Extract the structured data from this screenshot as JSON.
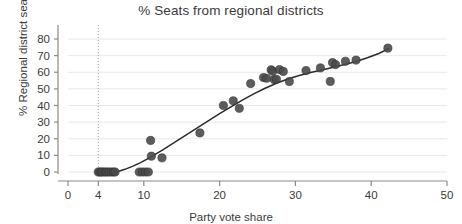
{
  "chart_data": {
    "type": "scatter",
    "title": "% Seats from regional districts",
    "xlabel": "Party vote share",
    "ylabel": "% Regional district seats",
    "xlim": [
      0,
      50
    ],
    "ylim": [
      -3,
      85
    ],
    "xticks": [
      0,
      4,
      10,
      20,
      30,
      40,
      50
    ],
    "xtick_labels": [
      "0",
      "4",
      "10",
      "20",
      "30",
      "40",
      "50"
    ],
    "yticks": [
      0,
      10,
      20,
      30,
      40,
      50,
      60,
      70,
      80
    ],
    "ytick_labels": [
      "0",
      "10",
      "20",
      "30",
      "40",
      "50",
      "60",
      "70",
      "80"
    ],
    "grid": "horizontal",
    "legend": "none",
    "marker_color": "#4a4a4a",
    "line_color": "#2b2b2b",
    "gridline_color": "#e8e8e8",
    "axis_color": "#8a8a8a",
    "reference_line": {
      "orientation": "vertical",
      "x": 4,
      "style": "dotted",
      "color": "#b0a89a"
    },
    "points": [
      {
        "x": 4.0,
        "y": 0.0
      },
      {
        "x": 4.2,
        "y": 0.0
      },
      {
        "x": 4.4,
        "y": 0.0
      },
      {
        "x": 4.6,
        "y": 0.0
      },
      {
        "x": 4.9,
        "y": 0.0
      },
      {
        "x": 5.1,
        "y": 0.0
      },
      {
        "x": 5.4,
        "y": 0.0
      },
      {
        "x": 5.7,
        "y": 0.0
      },
      {
        "x": 6.0,
        "y": 0.0
      },
      {
        "x": 6.2,
        "y": 0.0
      },
      {
        "x": 9.4,
        "y": 0.0
      },
      {
        "x": 9.8,
        "y": 0.0
      },
      {
        "x": 10.2,
        "y": 0.0
      },
      {
        "x": 10.6,
        "y": 0.0
      },
      {
        "x": 10.9,
        "y": 19.0
      },
      {
        "x": 11.0,
        "y": 9.5
      },
      {
        "x": 12.4,
        "y": 8.5
      },
      {
        "x": 17.4,
        "y": 23.5
      },
      {
        "x": 20.5,
        "y": 40.0
      },
      {
        "x": 21.8,
        "y": 42.8
      },
      {
        "x": 22.6,
        "y": 38.3
      },
      {
        "x": 24.1,
        "y": 53.2
      },
      {
        "x": 25.8,
        "y": 56.8
      },
      {
        "x": 26.2,
        "y": 56.4
      },
      {
        "x": 26.8,
        "y": 61.5
      },
      {
        "x": 27.0,
        "y": 60.6
      },
      {
        "x": 27.2,
        "y": 55.6
      },
      {
        "x": 27.5,
        "y": 55.8
      },
      {
        "x": 27.9,
        "y": 61.6
      },
      {
        "x": 28.4,
        "y": 60.5
      },
      {
        "x": 29.2,
        "y": 54.4
      },
      {
        "x": 31.4,
        "y": 61.0
      },
      {
        "x": 33.3,
        "y": 62.6
      },
      {
        "x": 34.6,
        "y": 54.5
      },
      {
        "x": 34.9,
        "y": 65.8
      },
      {
        "x": 35.3,
        "y": 64.6
      },
      {
        "x": 36.6,
        "y": 66.6
      },
      {
        "x": 38.0,
        "y": 67.3
      },
      {
        "x": 42.2,
        "y": 74.5
      }
    ],
    "fit_line": [
      {
        "x": 4.0,
        "y": -0.6
      },
      {
        "x": 5.5,
        "y": -0.5
      },
      {
        "x": 6.5,
        "y": 0.2
      },
      {
        "x": 7.5,
        "y": 1.6
      },
      {
        "x": 8.5,
        "y": 3.4
      },
      {
        "x": 9.5,
        "y": 5.5
      },
      {
        "x": 10.5,
        "y": 7.9
      },
      {
        "x": 11.5,
        "y": 10.6
      },
      {
        "x": 12.5,
        "y": 13.3
      },
      {
        "x": 14.0,
        "y": 17.6
      },
      {
        "x": 15.5,
        "y": 22.0
      },
      {
        "x": 17.0,
        "y": 26.4
      },
      {
        "x": 18.5,
        "y": 30.8
      },
      {
        "x": 20.0,
        "y": 35.1
      },
      {
        "x": 21.5,
        "y": 39.2
      },
      {
        "x": 23.0,
        "y": 43.2
      },
      {
        "x": 24.5,
        "y": 47.0
      },
      {
        "x": 26.0,
        "y": 50.4
      },
      {
        "x": 27.5,
        "y": 53.4
      },
      {
        "x": 29.0,
        "y": 55.9
      },
      {
        "x": 30.5,
        "y": 58.0
      },
      {
        "x": 32.0,
        "y": 59.8
      },
      {
        "x": 33.5,
        "y": 61.4
      },
      {
        "x": 35.0,
        "y": 63.0
      },
      {
        "x": 36.5,
        "y": 64.7
      },
      {
        "x": 38.0,
        "y": 66.5
      },
      {
        "x": 39.5,
        "y": 68.7
      },
      {
        "x": 41.0,
        "y": 71.3
      },
      {
        "x": 42.3,
        "y": 74.2
      }
    ]
  }
}
